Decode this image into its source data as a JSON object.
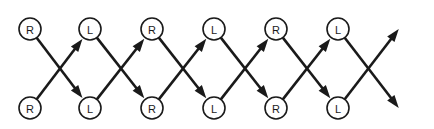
{
  "diagram": {
    "type": "trellis-lattice",
    "title": "",
    "width": 434,
    "height": 129,
    "background_color": "#ffffff",
    "stroke_color": "#1a1a1a",
    "node_fill_color": "#ffffff",
    "node_radius": 11,
    "rows": [
      {
        "name": "top-row",
        "y": 29,
        "nodes": [
          {
            "label": "R",
            "x": 30
          },
          {
            "label": "L",
            "x": 90
          },
          {
            "label": "R",
            "x": 152
          },
          {
            "label": "L",
            "x": 214
          },
          {
            "label": "R",
            "x": 276
          },
          {
            "label": "L",
            "x": 338
          }
        ]
      },
      {
        "name": "bottom-row",
        "y": 108,
        "nodes": [
          {
            "label": "R",
            "x": 30
          },
          {
            "label": "L",
            "x": 90
          },
          {
            "label": "R",
            "x": 152
          },
          {
            "label": "L",
            "x": 214
          },
          {
            "label": "R",
            "x": 276
          },
          {
            "label": "L",
            "x": 338
          }
        ]
      }
    ],
    "edges": [
      {
        "name": "edge-top1-to-bottom2",
        "from": "top-1",
        "to": "bottom-2",
        "direction": "down-right",
        "arrowhead": true
      },
      {
        "name": "edge-bottom1-to-top2",
        "from": "bottom-1",
        "to": "top-2",
        "direction": "up-right",
        "arrowhead": true
      },
      {
        "name": "edge-top2-to-bottom3",
        "from": "top-2",
        "to": "bottom-3",
        "direction": "down-right",
        "arrowhead": true
      },
      {
        "name": "edge-bottom2-to-top3",
        "from": "bottom-2",
        "to": "top-3",
        "direction": "up-right",
        "arrowhead": true
      },
      {
        "name": "edge-top3-to-bottom4",
        "from": "top-3",
        "to": "bottom-4",
        "direction": "down-right",
        "arrowhead": true
      },
      {
        "name": "edge-bottom3-to-top4",
        "from": "bottom-3",
        "to": "top-4",
        "direction": "up-right",
        "arrowhead": true
      },
      {
        "name": "edge-top4-to-bottom5",
        "from": "top-4",
        "to": "bottom-5",
        "direction": "down-right",
        "arrowhead": true
      },
      {
        "name": "edge-bottom4-to-top5",
        "from": "bottom-4",
        "to": "top-5",
        "direction": "up-right",
        "arrowhead": true
      },
      {
        "name": "edge-top5-to-bottom6",
        "from": "top-5",
        "to": "bottom-6",
        "direction": "down-right",
        "arrowhead": true
      },
      {
        "name": "edge-bottom5-to-top6",
        "from": "bottom-5",
        "to": "top-6",
        "direction": "up-right",
        "arrowhead": true
      },
      {
        "name": "edge-top6-to-right-exit",
        "from": "top-6",
        "to": "right-edge-lower",
        "direction": "down-right",
        "arrowhead": true
      },
      {
        "name": "edge-bottom6-to-right-exit",
        "from": "bottom-6",
        "to": "right-edge-upper",
        "direction": "up-right",
        "arrowhead": true
      }
    ]
  }
}
